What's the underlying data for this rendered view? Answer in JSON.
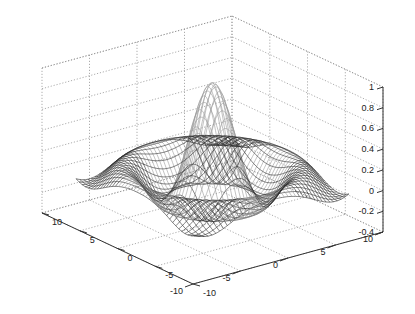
{
  "chart_data": {
    "type": "surface3d",
    "title": "",
    "xlabel": "",
    "ylabel": "",
    "zlabel": "",
    "x_ticks": [
      -10,
      -5,
      0,
      5,
      10
    ],
    "y_ticks": [
      -10,
      -5,
      0,
      5,
      10
    ],
    "z_ticks": [
      -0.4,
      -0.2,
      0,
      0.2,
      0.4,
      0.6,
      0.8,
      1
    ],
    "xlim": [
      -10,
      10
    ],
    "ylim": [
      -10,
      10
    ],
    "zlim": [
      -0.4,
      1
    ],
    "grid": true,
    "line_color": "#333333",
    "grid_color": "#888888",
    "peak": {
      "x": 0,
      "y": 0,
      "z": 0.95
    }
  },
  "axes": {
    "z_tick_labels": [
      "1",
      "0.8",
      "0.6",
      "0.4",
      "0.2",
      "0",
      "-0.2",
      "-0.4"
    ],
    "left_axis_tick_labels": [
      "10",
      "5",
      "0",
      "-5",
      "-10"
    ],
    "right_axis_tick_labels": [
      "-10",
      "-5",
      "0",
      "5",
      "10"
    ]
  }
}
